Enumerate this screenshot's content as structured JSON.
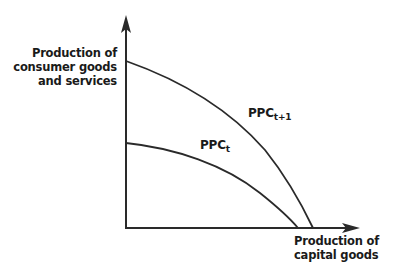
{
  "diagram": {
    "type": "production-possibility-curve",
    "y_axis": {
      "label_lines": [
        "Production of",
        "consumer goods",
        "and services"
      ]
    },
    "x_axis": {
      "label_lines": [
        "Production of",
        "capital goods"
      ]
    },
    "curves": [
      {
        "id": "ppc_t",
        "label_main": "PPC",
        "label_sub": "t",
        "y_intercept_px": 143,
        "x_intercept_px": 298
      },
      {
        "id": "ppc_t1",
        "label_main": "PPC",
        "label_sub": "t+1",
        "y_intercept_px": 61,
        "x_intercept_px": 313
      }
    ],
    "colors": {
      "axis": "#2a2a2a",
      "curve": "#2a2a2a",
      "text": "#1a1a1a"
    }
  }
}
